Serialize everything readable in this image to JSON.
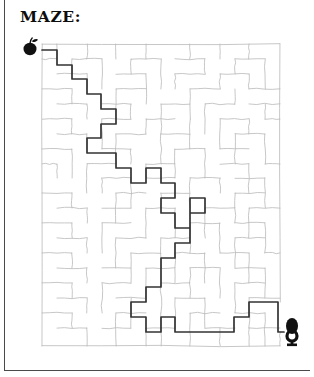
{
  "page": {
    "title": "MAZE:",
    "background_color": "#ffffff",
    "border_color": "#4a4a4a",
    "width": 314,
    "height": 377
  },
  "maze": {
    "name": "hand-drawn-rectangular-maze",
    "wall_color": "#b9b9b9",
    "solution_color": "#333333",
    "marker_color": "#111111",
    "bounds": {
      "x": 42,
      "y": 44,
      "width": 238,
      "height": 302
    },
    "grid": {
      "cols": 16,
      "rows": 20,
      "cell": 14.9
    },
    "start_marker": {
      "name": "apple-icon",
      "label": "apple",
      "x": 30,
      "y": 49
    },
    "end_marker": {
      "name": "trophy-icon",
      "label": "trophy",
      "x": 292,
      "y": 333
    },
    "solution_points": [
      [
        42,
        50
      ],
      [
        57,
        50
      ],
      [
        57,
        65
      ],
      [
        72,
        65
      ],
      [
        72,
        79
      ],
      [
        87,
        79
      ],
      [
        87,
        94
      ],
      [
        101,
        94
      ],
      [
        101,
        109
      ],
      [
        116,
        109
      ],
      [
        116,
        124
      ],
      [
        101,
        124
      ],
      [
        101,
        138
      ],
      [
        87,
        138
      ],
      [
        87,
        153
      ],
      [
        116,
        153
      ],
      [
        116,
        168
      ],
      [
        131,
        168
      ],
      [
        131,
        183
      ],
      [
        146,
        183
      ],
      [
        146,
        168
      ],
      [
        161,
        168
      ],
      [
        161,
        183
      ],
      [
        175,
        183
      ],
      [
        175,
        198
      ],
      [
        161,
        198
      ],
      [
        161,
        213
      ],
      [
        175,
        213
      ],
      [
        175,
        228
      ],
      [
        190,
        228
      ],
      [
        190,
        198
      ],
      [
        205,
        198
      ],
      [
        205,
        213
      ],
      [
        190,
        213
      ],
      [
        190,
        243
      ],
      [
        175,
        243
      ],
      [
        175,
        258
      ],
      [
        161,
        258
      ],
      [
        161,
        287
      ],
      [
        146,
        287
      ],
      [
        146,
        302
      ],
      [
        131,
        302
      ],
      [
        131,
        317
      ],
      [
        146,
        317
      ],
      [
        146,
        332
      ],
      [
        161,
        332
      ],
      [
        161,
        317
      ],
      [
        175,
        317
      ],
      [
        175,
        332
      ],
      [
        234,
        332
      ],
      [
        234,
        317
      ],
      [
        249,
        317
      ],
      [
        249,
        302
      ],
      [
        278,
        302
      ],
      [
        278,
        332
      ],
      [
        284,
        332
      ]
    ],
    "wall_segments": [
      [
        42,
        44,
        280,
        44
      ],
      [
        42,
        44,
        42,
        346
      ],
      [
        280,
        44,
        280,
        302
      ],
      [
        280,
        332,
        280,
        346
      ],
      [
        42,
        346,
        280,
        346
      ],
      [
        57,
        44,
        57,
        59
      ],
      [
        87,
        44,
        87,
        59
      ],
      [
        116,
        44,
        116,
        59
      ],
      [
        146,
        44,
        146,
        59
      ],
      [
        190,
        44,
        190,
        59
      ],
      [
        220,
        44,
        220,
        59
      ],
      [
        249,
        44,
        249,
        59
      ],
      [
        42,
        59,
        57,
        59
      ],
      [
        72,
        59,
        102,
        59
      ],
      [
        131,
        59,
        161,
        59
      ],
      [
        175,
        59,
        205,
        59
      ],
      [
        235,
        59,
        265,
        59
      ],
      [
        72,
        59,
        72,
        74
      ],
      [
        102,
        59,
        102,
        89
      ],
      [
        131,
        59,
        131,
        74
      ],
      [
        161,
        59,
        161,
        89
      ],
      [
        205,
        59,
        205,
        74
      ],
      [
        235,
        59,
        235,
        74
      ],
      [
        265,
        59,
        265,
        89
      ],
      [
        57,
        74,
        87,
        74
      ],
      [
        116,
        74,
        146,
        74
      ],
      [
        175,
        74,
        205,
        74
      ],
      [
        220,
        74,
        249,
        74
      ],
      [
        87,
        74,
        87,
        89
      ],
      [
        146,
        74,
        146,
        104
      ],
      [
        175,
        74,
        175,
        89
      ],
      [
        220,
        74,
        220,
        89
      ],
      [
        249,
        74,
        249,
        89
      ],
      [
        42,
        89,
        72,
        89
      ],
      [
        116,
        89,
        146,
        89
      ],
      [
        190,
        89,
        220,
        89
      ],
      [
        249,
        89,
        280,
        89
      ],
      [
        72,
        89,
        72,
        104
      ],
      [
        116,
        89,
        116,
        119
      ],
      [
        190,
        89,
        190,
        119
      ],
      [
        235,
        89,
        235,
        104
      ],
      [
        57,
        104,
        87,
        104
      ],
      [
        102,
        104,
        131,
        104
      ],
      [
        161,
        104,
        190,
        104
      ],
      [
        205,
        104,
        235,
        104
      ],
      [
        249,
        104,
        280,
        104
      ],
      [
        87,
        104,
        87,
        119
      ],
      [
        131,
        104,
        131,
        119
      ],
      [
        161,
        104,
        161,
        134
      ],
      [
        205,
        104,
        205,
        134
      ],
      [
        265,
        104,
        265,
        119
      ],
      [
        42,
        119,
        72,
        119
      ],
      [
        102,
        119,
        131,
        119
      ],
      [
        146,
        119,
        175,
        119
      ],
      [
        220,
        119,
        249,
        119
      ],
      [
        265,
        119,
        280,
        119
      ],
      [
        72,
        119,
        72,
        134
      ],
      [
        102,
        119,
        102,
        149
      ],
      [
        146,
        119,
        146,
        134
      ],
      [
        190,
        119,
        190,
        149
      ],
      [
        220,
        119,
        220,
        149
      ],
      [
        249,
        119,
        249,
        134
      ],
      [
        57,
        134,
        87,
        134
      ],
      [
        116,
        134,
        146,
        134
      ],
      [
        161,
        134,
        190,
        134
      ],
      [
        235,
        134,
        265,
        134
      ],
      [
        87,
        134,
        87,
        149
      ],
      [
        116,
        134,
        116,
        164
      ],
      [
        161,
        134,
        161,
        164
      ],
      [
        235,
        134,
        235,
        164
      ],
      [
        265,
        134,
        265,
        164
      ],
      [
        42,
        149,
        72,
        149
      ],
      [
        102,
        149,
        131,
        149
      ],
      [
        175,
        149,
        205,
        149
      ],
      [
        220,
        149,
        249,
        149
      ],
      [
        72,
        149,
        72,
        178
      ],
      [
        131,
        149,
        131,
        164
      ],
      [
        175,
        149,
        175,
        178
      ],
      [
        205,
        149,
        205,
        178
      ],
      [
        42,
        164,
        57,
        164
      ],
      [
        87,
        164,
        116,
        164
      ],
      [
        146,
        164,
        175,
        164
      ],
      [
        220,
        164,
        249,
        164
      ],
      [
        265,
        164,
        280,
        164
      ],
      [
        57,
        164,
        57,
        178
      ],
      [
        87,
        164,
        87,
        193
      ],
      [
        146,
        164,
        146,
        178
      ],
      [
        249,
        164,
        249,
        193
      ],
      [
        102,
        178,
        131,
        178
      ],
      [
        146,
        178,
        175,
        178
      ],
      [
        190,
        178,
        220,
        178
      ],
      [
        235,
        178,
        265,
        178
      ],
      [
        102,
        178,
        102,
        193
      ],
      [
        131,
        178,
        131,
        208
      ],
      [
        190,
        178,
        190,
        208
      ],
      [
        220,
        178,
        220,
        193
      ],
      [
        265,
        178,
        265,
        208
      ],
      [
        42,
        193,
        72,
        193
      ],
      [
        116,
        193,
        146,
        193
      ],
      [
        161,
        193,
        190,
        193
      ],
      [
        235,
        193,
        265,
        193
      ],
      [
        72,
        193,
        72,
        208
      ],
      [
        116,
        193,
        116,
        223
      ],
      [
        161,
        193,
        161,
        208
      ],
      [
        235,
        193,
        235,
        223
      ],
      [
        57,
        208,
        87,
        208
      ],
      [
        102,
        208,
        131,
        208
      ],
      [
        146,
        208,
        175,
        208
      ],
      [
        205,
        208,
        235,
        208
      ],
      [
        249,
        208,
        280,
        208
      ],
      [
        87,
        208,
        87,
        223
      ],
      [
        146,
        208,
        146,
        238
      ],
      [
        175,
        208,
        175,
        238
      ],
      [
        205,
        208,
        205,
        238
      ],
      [
        249,
        208,
        249,
        238
      ],
      [
        42,
        223,
        72,
        223
      ],
      [
        102,
        223,
        131,
        223
      ],
      [
        190,
        223,
        220,
        223
      ],
      [
        235,
        223,
        265,
        223
      ],
      [
        72,
        223,
        72,
        238
      ],
      [
        102,
        223,
        102,
        253
      ],
      [
        190,
        223,
        190,
        253
      ],
      [
        220,
        223,
        220,
        253
      ],
      [
        265,
        223,
        265,
        253
      ],
      [
        57,
        238,
        87,
        238
      ],
      [
        116,
        238,
        146,
        238
      ],
      [
        161,
        238,
        190,
        238
      ],
      [
        235,
        238,
        265,
        238
      ],
      [
        87,
        238,
        87,
        253
      ],
      [
        116,
        238,
        116,
        268
      ],
      [
        161,
        238,
        161,
        268
      ],
      [
        235,
        238,
        235,
        268
      ],
      [
        42,
        253,
        72,
        253
      ],
      [
        131,
        253,
        161,
        253
      ],
      [
        175,
        253,
        205,
        253
      ],
      [
        220,
        253,
        249,
        253
      ],
      [
        265,
        253,
        280,
        253
      ],
      [
        72,
        253,
        72,
        268
      ],
      [
        131,
        253,
        131,
        283
      ],
      [
        175,
        253,
        175,
        283
      ],
      [
        205,
        253,
        205,
        283
      ],
      [
        249,
        253,
        249,
        283
      ],
      [
        57,
        268,
        87,
        268
      ],
      [
        102,
        268,
        131,
        268
      ],
      [
        146,
        268,
        175,
        268
      ],
      [
        190,
        268,
        220,
        268
      ],
      [
        235,
        268,
        265,
        268
      ],
      [
        87,
        268,
        87,
        283
      ],
      [
        146,
        268,
        146,
        298
      ],
      [
        190,
        268,
        190,
        298
      ],
      [
        220,
        268,
        220,
        298
      ],
      [
        265,
        268,
        265,
        298
      ],
      [
        42,
        283,
        72,
        283
      ],
      [
        102,
        283,
        131,
        283
      ],
      [
        161,
        283,
        190,
        283
      ],
      [
        235,
        283,
        265,
        283
      ],
      [
        72,
        283,
        72,
        298
      ],
      [
        102,
        283,
        102,
        313
      ],
      [
        161,
        283,
        161,
        313
      ],
      [
        235,
        283,
        235,
        313
      ],
      [
        57,
        298,
        87,
        298
      ],
      [
        116,
        298,
        146,
        298
      ],
      [
        175,
        298,
        205,
        298
      ],
      [
        249,
        298,
        280,
        298
      ],
      [
        87,
        298,
        87,
        313
      ],
      [
        131,
        298,
        131,
        328
      ],
      [
        175,
        298,
        175,
        328
      ],
      [
        205,
        298,
        205,
        328
      ],
      [
        249,
        298,
        249,
        328
      ],
      [
        42,
        313,
        72,
        313
      ],
      [
        116,
        313,
        146,
        313
      ],
      [
        190,
        313,
        220,
        313
      ],
      [
        235,
        313,
        265,
        313
      ],
      [
        72,
        313,
        72,
        328
      ],
      [
        116,
        313,
        116,
        346
      ],
      [
        161,
        313,
        161,
        346
      ],
      [
        190,
        313,
        190,
        346
      ],
      [
        265,
        313,
        265,
        346
      ],
      [
        57,
        328,
        87,
        328
      ],
      [
        102,
        328,
        131,
        328
      ],
      [
        146,
        328,
        175,
        328
      ],
      [
        205,
        328,
        235,
        328
      ],
      [
        249,
        328,
        280,
        328
      ],
      [
        87,
        328,
        87,
        346
      ],
      [
        146,
        328,
        146,
        346
      ],
      [
        220,
        328,
        220,
        346
      ],
      [
        249,
        328,
        249,
        346
      ]
    ]
  }
}
